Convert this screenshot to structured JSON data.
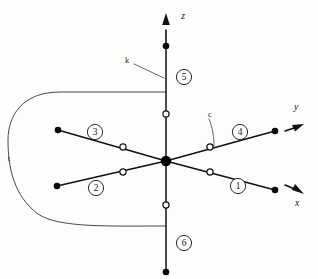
{
  "figure": {
    "background_color": "#fdfdfd",
    "line_color": "#101010",
    "curve_color": "#4a4a4a",
    "marker_filled_color": "#0a0a0a",
    "marker_hollow_fill": "#ffffff"
  },
  "axes": [
    {
      "id": "axis-z",
      "label": "z",
      "label_x": 183,
      "label_y": 16,
      "orientation": "vertical-up",
      "arrow_tip_x": 166,
      "arrow_tip_y": 14,
      "line_x1": 166,
      "line_y1": 30,
      "line_x2": 166,
      "line_y2": 46
    },
    {
      "id": "axis-y",
      "label": "y",
      "label_x": 296,
      "label_y": 107,
      "orientation": "diagonal-upper-right",
      "arrow_tip_x": 302,
      "arrow_tip_y": 124,
      "line_x1": 285,
      "line_y1": 131,
      "line_x2": 296,
      "line_y2": 126
    },
    {
      "id": "axis-x",
      "label": "x",
      "label_x": 297,
      "label_y": 203,
      "orientation": "diagonal-lower-right",
      "arrow_tip_x": 302,
      "arrow_tip_y": 192,
      "line_x1": 285,
      "line_y1": 185,
      "line_x2": 296,
      "line_y2": 191
    }
  ],
  "origin": {
    "id": "origin-node",
    "x": 166,
    "y": 161,
    "radius": 5.2
  },
  "directions": [
    {
      "id": "direction-1",
      "badge_label": "1",
      "badge_x": 238,
      "badge_y": 186,
      "badge_radius": 7.6,
      "line_x1": 166,
      "line_y1": 161,
      "line_x2": 275,
      "line_y2": 190,
      "endpoint_x": 275,
      "endpoint_y": 190,
      "hollow_x": 210,
      "hollow_y": 172,
      "axis": "x-positive"
    },
    {
      "id": "direction-2",
      "badge_label": "2",
      "badge_x": 96,
      "badge_y": 188,
      "badge_radius": 7.6,
      "line_x1": 166,
      "line_y1": 161,
      "line_x2": 57,
      "line_y2": 186,
      "endpoint_x": 57,
      "endpoint_y": 186,
      "hollow_x": 123,
      "hollow_y": 172,
      "axis": "x-negative"
    },
    {
      "id": "direction-3",
      "badge_label": "3",
      "badge_x": 95,
      "badge_y": 132,
      "badge_radius": 7.6,
      "line_x1": 166,
      "line_y1": 161,
      "line_x2": 58,
      "line_y2": 130,
      "endpoint_x": 58,
      "endpoint_y": 130,
      "hollow_x": 123,
      "hollow_y": 147,
      "axis": "y-negative"
    },
    {
      "id": "direction-4",
      "badge_label": "4",
      "badge_x": 240,
      "badge_y": 132,
      "badge_radius": 7.6,
      "line_x1": 166,
      "line_y1": 161,
      "line_x2": 275,
      "line_y2": 131,
      "endpoint_x": 275,
      "endpoint_y": 131,
      "hollow_x": 210,
      "hollow_y": 147,
      "axis": "y-positive"
    },
    {
      "id": "direction-5",
      "badge_label": "5",
      "badge_x": 184,
      "badge_y": 77,
      "badge_radius": 7.6,
      "line_x1": 166,
      "line_y1": 161,
      "line_x2": 166,
      "line_y2": 46,
      "endpoint_x": 166,
      "endpoint_y": 46,
      "hollow_x": 166,
      "hollow_y": 114,
      "axis": "z-positive"
    },
    {
      "id": "direction-6",
      "badge_label": "6",
      "badge_x": 184,
      "badge_y": 243,
      "badge_radius": 7.6,
      "line_x1": 166,
      "line_y1": 161,
      "line_x2": 166,
      "line_y2": 272,
      "endpoint_x": 166,
      "endpoint_y": 272,
      "hollow_x": 166,
      "hollow_y": 205,
      "axis": "z-negative"
    }
  ],
  "feature_labels": [
    {
      "id": "label-k",
      "text": "k",
      "x": 127,
      "y": 60,
      "leader_x1": 134,
      "leader_y1": 64,
      "leader_x2": 164,
      "leader_y2": 78
    },
    {
      "id": "label-c",
      "text": "c",
      "x": 210,
      "y": 114,
      "leader_x1": 209,
      "leader_y1": 119,
      "leader_x2": 214,
      "leader_y2": 145
    },
    {
      "id": "label-t",
      "text": "t",
      "x": 9,
      "y": 158,
      "leader_x1": 0,
      "leader_y1": 0,
      "leader_x2": 0,
      "leader_y2": 0
    }
  ],
  "contour": {
    "id": "contour-t",
    "description": "Closed rounded contour enclosing the negative x-y region, terminating on the z-axis",
    "path": "M 166 92 L 60 92 C 22 92 8 116 8 140 C 8 168 14 196 38 214 C 58 228 110 226 166 226"
  }
}
